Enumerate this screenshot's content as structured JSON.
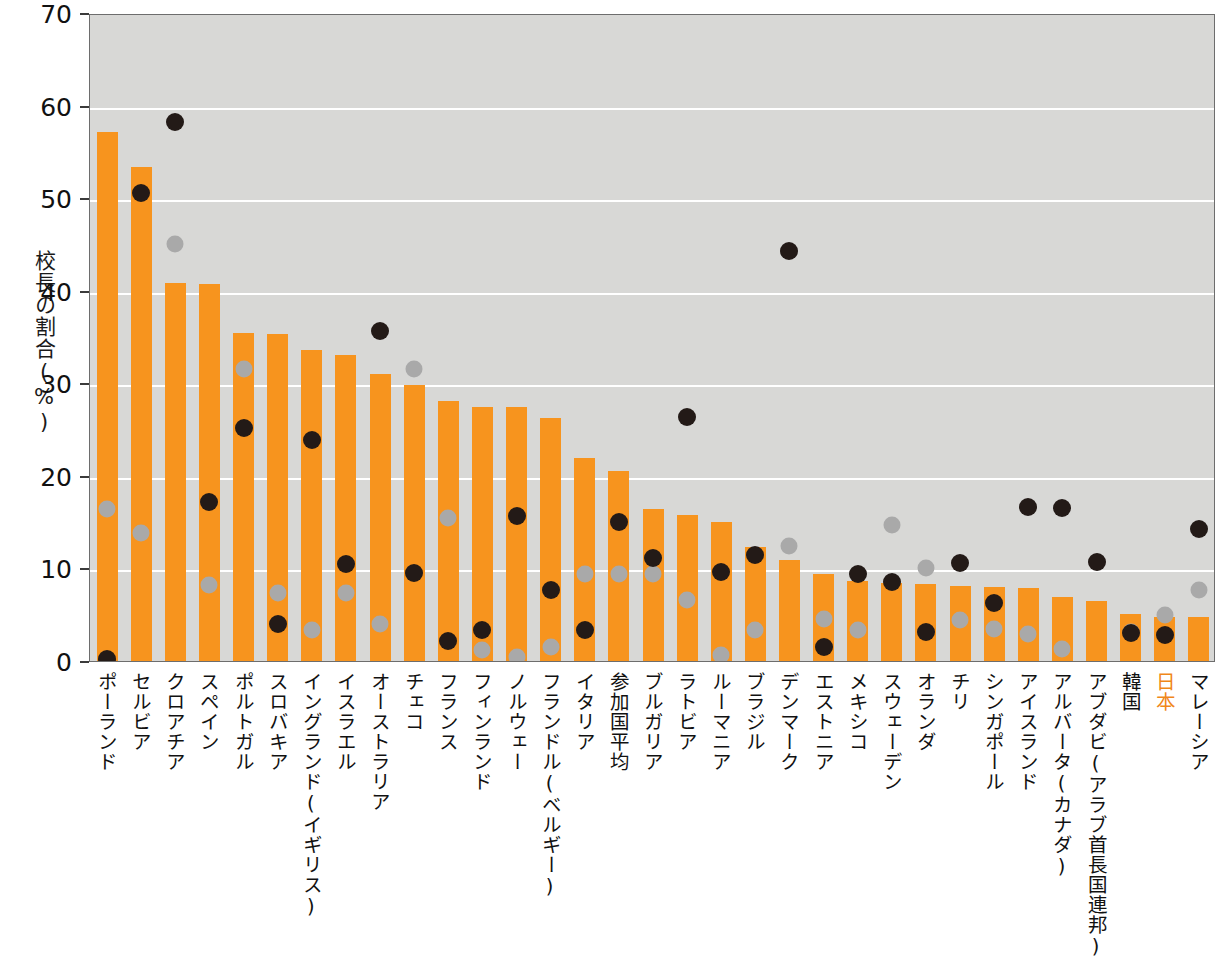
{
  "chart_data": {
    "type": "bar",
    "title": "",
    "xlabel": "",
    "ylabel": "校長の割合(%)",
    "ylim": [
      0,
      70
    ],
    "yticks": [
      0,
      10,
      20,
      30,
      40,
      50,
      60,
      70
    ],
    "grid": true,
    "legend_position": "none",
    "highlight_category": "参加国平均",
    "highlight_color": "#fce0c4",
    "bar_color": "#f7941e",
    "black_dot_color": "#231a17",
    "gray_dot_color": "#a9a9a9",
    "plot_background": "#d8d8d6",
    "categories": [
      "ポーランド",
      "セルビア",
      "クロアチア",
      "スペイン",
      "ポルトガル",
      "スロバキア",
      "イングランド(イギリス)",
      "イスラエル",
      "オーストラリア",
      "チェコ",
      "フランス",
      "フィンランド",
      "ノルウェー",
      "フランドル(ベルギー)",
      "イタリア",
      "参加国平均",
      "ブルガリア",
      "ラトビア",
      "ルーマニア",
      "ブラジル",
      "デンマーク",
      "エストニア",
      "メキシコ",
      "スウェーデン",
      "オランダ",
      "チリ",
      "シンガポール",
      "アイスランド",
      "アルバータ(カナダ)",
      "アブダビ(アラブ首長国連邦)",
      "韓国",
      "日本",
      "マレーシア"
    ],
    "series": [
      {
        "name": "bars",
        "kind": "bar",
        "values": [
          57.2,
          53.4,
          40.8,
          40.7,
          35.4,
          35.3,
          33.6,
          33.1,
          31.0,
          29.8,
          28.1,
          27.4,
          27.4,
          26.3,
          21.9,
          20.5,
          16.4,
          15.8,
          15.0,
          12.3,
          10.9,
          9.4,
          8.6,
          8.4,
          8.3,
          8.1,
          8.0,
          7.9,
          6.9,
          6.5,
          5.1,
          4.8,
          4.8
        ]
      },
      {
        "name": "black-markers",
        "kind": "scatter",
        "values": [
          0.2,
          50.6,
          58.2,
          17.2,
          25.2,
          4.0,
          23.9,
          10.5,
          35.7,
          9.5,
          2.2,
          3.3,
          15.7,
          7.7,
          3.4,
          15.0,
          11.1,
          26.4,
          9.6,
          11.4,
          44.3,
          1.5,
          9.4,
          8.5,
          3.1,
          10.6,
          6.3,
          16.6,
          16.5,
          10.7,
          3.0,
          2.8,
          14.3
        ]
      },
      {
        "name": "gray-markers",
        "kind": "scatter",
        "values": [
          16.4,
          13.8,
          45.0,
          8.2,
          31.5,
          7.3,
          3.4,
          7.4,
          4.0,
          31.5,
          15.5,
          1.2,
          0.4,
          1.5,
          9.4,
          9.4,
          9.4,
          6.6,
          0.7,
          3.3,
          12.4,
          4.5,
          3.3,
          14.7,
          10.1,
          4.4,
          3.5,
          2.9,
          1.3,
          10.7,
          3.1,
          5.0,
          7.7
        ]
      }
    ]
  },
  "axis": {
    "y_title": "校長の割合(%)",
    "tick_labels": [
      "70",
      "60",
      "50",
      "40",
      "30",
      "20",
      "10",
      "0"
    ]
  }
}
